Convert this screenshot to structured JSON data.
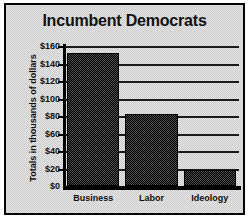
{
  "chart_data": {
    "type": "bar",
    "title": "Incumbent Democrats",
    "xlabel": "",
    "ylabel": "Totals in thousands of dollars",
    "categories": [
      "Business",
      "Labor",
      "Ideology"
    ],
    "values": [
      152,
      82,
      18
    ],
    "ylim": [
      0,
      160
    ],
    "ytick_labels": [
      "$160",
      "$140",
      "$120",
      "$100",
      "$80",
      "$60",
      "$40",
      "$20",
      "$0"
    ],
    "ytick_values": [
      160,
      140,
      120,
      100,
      80,
      60,
      40,
      20,
      0
    ],
    "grid": true,
    "legend": false,
    "series": [
      {
        "name": "Incumbent Democrats",
        "values": [
          152,
          82,
          18
        ],
        "color": "#222222"
      }
    ]
  },
  "style": {
    "bar_color": "#222222",
    "frame_color": "#000000",
    "background_color": "#d8d8d8",
    "text_color": "#111111"
  }
}
